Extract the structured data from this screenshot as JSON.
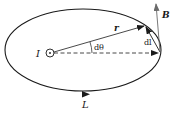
{
  "diagram": {
    "title": "",
    "labels": {
      "current": "I",
      "radius": "r",
      "angle": "dθ",
      "element": "dl",
      "field": "B",
      "loop": "L"
    },
    "colors": {
      "stroke": "#1a1a1a",
      "field_arrow": "#6b6b6b",
      "background": "#ffffff"
    }
  }
}
